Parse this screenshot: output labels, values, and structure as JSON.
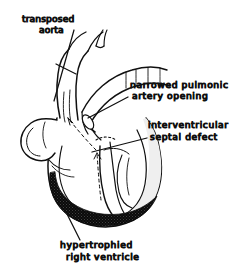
{
  "figure": {
    "background_color": "#ffffff",
    "ink_color": "#101010",
    "shading": {
      "hypertrophied_wall_color": "#000000",
      "chamber_fill_color": "#ffffff",
      "light_tissue_color": "#f0f0f0"
    },
    "labels": [
      {
        "id": "transposed-aorta",
        "lines": [
          "transposed",
          "aorta"
        ],
        "line1": "transposed",
        "line2": "aorta",
        "x": 22,
        "y": 22,
        "align": "left",
        "leader": {
          "from_x": 74,
          "from_y": 30,
          "to_x": 54,
          "to_y": 101
        }
      },
      {
        "id": "narrowed-pulmonic-artery-opening",
        "lines": [
          "narrowed pulmonic",
          "artery opening"
        ],
        "line1": "narrowed pulmonic",
        "line2": "artery opening",
        "x": 130,
        "y": 88,
        "align": "left",
        "leader": {
          "from_x": 128,
          "from_y": 97,
          "to_x": 88,
          "to_y": 118
        }
      },
      {
        "id": "interventricular-septal-defect",
        "lines": [
          "interventricular",
          "septal defect"
        ],
        "line1": "interventricular",
        "line2": "septal defect",
        "x": 148,
        "y": 128,
        "align": "left",
        "leader": {
          "from_x": 147,
          "from_y": 138,
          "to_x": 92,
          "to_y": 152
        }
      },
      {
        "id": "hypertrophied-right-ventricle",
        "lines": [
          "hypertrophied",
          "right ventricle"
        ],
        "line1": "hypertrophied",
        "line2": "right ventricle",
        "x": 60,
        "y": 248,
        "align": "left",
        "leader": {
          "from_x": 80,
          "from_y": 240,
          "to_x": 67,
          "to_y": 214
        }
      }
    ],
    "anatomy": {
      "parts": [
        "transposed aorta",
        "pulmonary artery",
        "narrowed pulmonic valve opening",
        "interventricular septal defect",
        "hypertrophied right ventricle wall",
        "left ventricle",
        "right atrium",
        "left atrial appendage"
      ],
      "flow_arrows": 2,
      "flow_arrow_style": "dashed"
    }
  }
}
